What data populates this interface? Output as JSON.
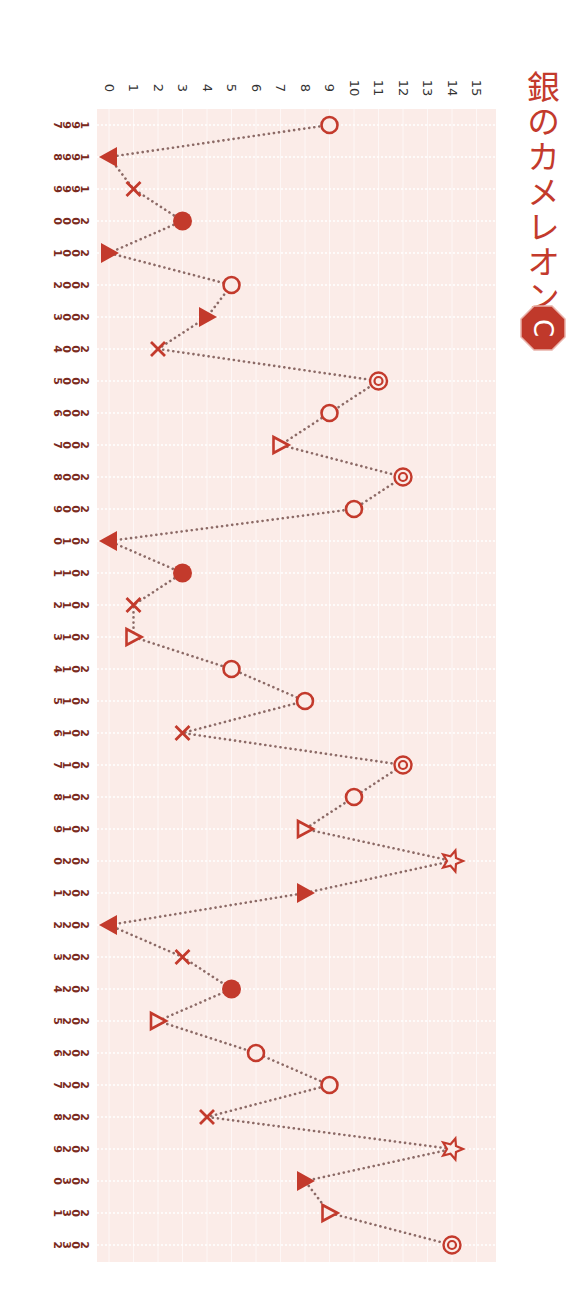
{
  "title": "銀のカメレオン",
  "badge": {
    "letter": "C",
    "color": "#c0392b"
  },
  "colors": {
    "accent": "#c33a2c",
    "plot_bg": "#fbece8",
    "grid": "#ffffff",
    "line": "#8c6a66",
    "year_label": "#7a2a20",
    "value_tick": "#333333"
  },
  "chart_data": {
    "type": "line",
    "orientation": "rotated-90-clockwise",
    "title": "銀のカメレオン",
    "xlabel": "",
    "ylabel": "",
    "ylim": [
      0,
      15
    ],
    "y_ticks": [
      0,
      1,
      2,
      3,
      4,
      5,
      6,
      7,
      8,
      9,
      10,
      11,
      12,
      13,
      14,
      15
    ],
    "grid": true,
    "legend": null,
    "categories": [
      "1997",
      "1998",
      "1999",
      "2000",
      "2001",
      "2002",
      "2003",
      "2004",
      "2005",
      "2006",
      "2007",
      "2008",
      "2009",
      "2010",
      "2011",
      "2012",
      "2013",
      "2014",
      "2015",
      "2016",
      "2017",
      "2018",
      "2019",
      "2020",
      "2021",
      "2022",
      "2023",
      "2024",
      "2025",
      "2026",
      "2027",
      "2028",
      "2029",
      "2030",
      "2031",
      "2032"
    ],
    "values": [
      9,
      0,
      1,
      3,
      0,
      5,
      4,
      2,
      11,
      9,
      7,
      12,
      10,
      0,
      3,
      1,
      1,
      5,
      8,
      3,
      12,
      10,
      8,
      14,
      8,
      0,
      3,
      5,
      2,
      6,
      9,
      4,
      14,
      8,
      9,
      14
    ],
    "markers": [
      "circle",
      "tri-down",
      "cross",
      "dot",
      "tri-up",
      "circle",
      "tri-up",
      "cross",
      "double-circle",
      "circle",
      "tri-open",
      "double-circle",
      "circle",
      "tri-down",
      "dot",
      "cross",
      "tri-open",
      "circle",
      "circle",
      "cross",
      "double-circle",
      "circle",
      "tri-open",
      "star",
      "tri-up",
      "tri-down",
      "cross",
      "dot",
      "tri-open",
      "circle",
      "circle",
      "cross",
      "star",
      "tri-up",
      "tri-open",
      "double-circle"
    ],
    "marker_legend": {
      "double-circle": "◎",
      "circle": "○",
      "tri-open": "△",
      "tri-up": "▲",
      "tri-down": "▼",
      "dot": "●",
      "cross": "×",
      "star": "☆"
    }
  }
}
